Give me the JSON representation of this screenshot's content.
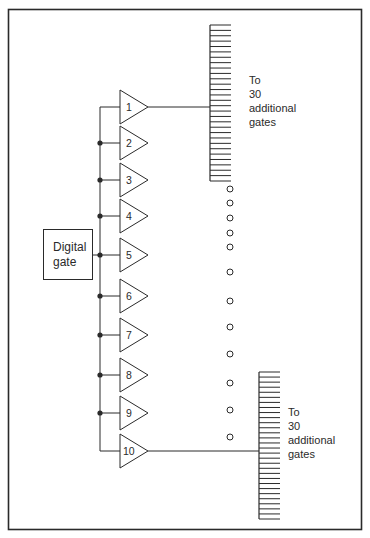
{
  "diagram": {
    "source_box": {
      "line1": "Digital",
      "line2": "gate"
    },
    "gates": [
      {
        "label": "1",
        "y": 107
      },
      {
        "label": "2",
        "y": 143
      },
      {
        "label": "3",
        "y": 180
      },
      {
        "label": "4",
        "y": 216
      },
      {
        "label": "5",
        "y": 255
      },
      {
        "label": "6",
        "y": 296
      },
      {
        "label": "7",
        "y": 335
      },
      {
        "label": "8",
        "y": 375
      },
      {
        "label": "9",
        "y": 413
      },
      {
        "label": "10",
        "y": 451
      }
    ],
    "top_fanout": {
      "line1": "To",
      "line2": "30",
      "line3": "additional",
      "line4": "gates"
    },
    "bottom_fanout": {
      "line1": "To",
      "line2": "30",
      "line3": "additional",
      "line4": "gates"
    },
    "continuation_dots": 12,
    "colors": {
      "line": "#2a2a2a",
      "background": "#ffffff"
    }
  }
}
